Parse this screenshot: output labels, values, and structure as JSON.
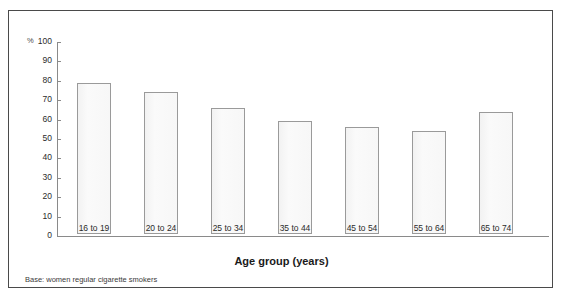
{
  "chart_data": {
    "type": "bar",
    "title": "",
    "subtitle": "",
    "xlabel": "Age group (years)",
    "ylabel": "%",
    "categories": [
      "16 to 19",
      "20 to 24",
      "25 to 34",
      "35 to 44",
      "45 to 54",
      "55 to 64",
      "65 to 74"
    ],
    "values": [
      78,
      73,
      65,
      58,
      55,
      53,
      63
    ],
    "ylim": [
      0,
      100
    ],
    "ytick_labels": [
      "100",
      "90",
      "80",
      "70",
      "60",
      "50",
      "40",
      "30",
      "20",
      "10",
      "0"
    ],
    "ytick_values": [
      100,
      90,
      80,
      70,
      60,
      50,
      40,
      30,
      20,
      10,
      0
    ],
    "grid": false,
    "legend": false,
    "legend_position": "none",
    "data_labels": [
      "78",
      "73",
      "65",
      "58",
      "55",
      "53",
      "63"
    ],
    "annotations": [
      "Base: women regular cigarette smokers"
    ],
    "percent_symbol": "%"
  },
  "figure": {
    "base_note": "Base: women regular cigarette smokers",
    "axis_title": "Age group (years)"
  },
  "colors": {
    "frame_border": "#4a4a4a",
    "axis_line": "#8a8a8a",
    "bar_border": "#9a9a9a",
    "bar_fill": "#f7f7f7",
    "text": "#2b2b2b",
    "background": "#ffffff"
  }
}
